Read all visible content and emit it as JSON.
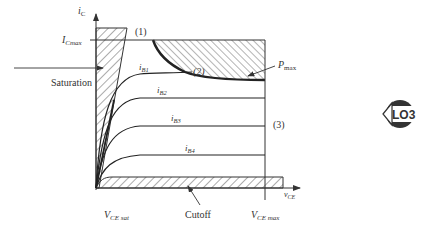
{
  "figure": {
    "axes": {
      "y_label_main": "i",
      "y_label_sub": "C",
      "x_label_main": "v",
      "x_label_sub": "CE"
    },
    "labels": {
      "ic_max_main": "I",
      "ic_max_sub": "Cmax",
      "saturation": "Saturation",
      "cutoff": "Cutoff",
      "pmax_main": "P",
      "pmax_sub": "max",
      "vce_sat_main": "V",
      "vce_sat_sub": "CE sat",
      "vce_max_main": "V",
      "vce_max_sub": "CE max",
      "marker_1": "(1)",
      "marker_2": "(2)",
      "marker_3": "(3)"
    },
    "curves": [
      {
        "main": "i",
        "sub": "B1"
      },
      {
        "main": "i",
        "sub": "B2"
      },
      {
        "main": "i",
        "sub": "B3"
      },
      {
        "main": "i",
        "sub": "B4"
      }
    ],
    "badge": {
      "text": "LO3",
      "color": "#333333"
    },
    "colors": {
      "line": "#333333",
      "hatch": "#444444",
      "background": "#ffffff"
    }
  }
}
